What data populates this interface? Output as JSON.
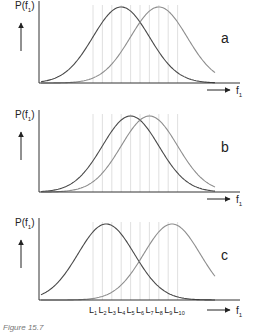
{
  "figure": {
    "caption": "Figure 15.7"
  },
  "chart_data": {
    "type": "line",
    "x_levels": [
      "L1",
      "L2",
      "L3",
      "L4",
      "L5",
      "L6",
      "L7",
      "L8",
      "L9",
      "L10"
    ],
    "level_positions": [
      1,
      2,
      3,
      4,
      5,
      6,
      7,
      8,
      9,
      10
    ],
    "xlabel_main": "f",
    "xlabel_sub": "1",
    "ylabel_main": "P(f",
    "ylabel_sub": "1",
    "ylabel_close": ")",
    "xlim": [
      -5.5,
      16
    ],
    "grid": false,
    "colors": {
      "curve_dark": "#4a4a4a",
      "curve_light": "#8e8e8e",
      "level_line": "#d8d8d8",
      "axis": "#333333"
    },
    "panels": [
      {
        "label": "a",
        "series": [
          {
            "name": "dark",
            "mean": 4.0,
            "sd": 3.0
          },
          {
            "name": "light",
            "mean": 8.0,
            "sd": 3.0
          }
        ]
      },
      {
        "label": "b",
        "series": [
          {
            "name": "dark",
            "mean": 5.0,
            "sd": 3.0
          },
          {
            "name": "light",
            "mean": 7.0,
            "sd": 3.0
          }
        ]
      },
      {
        "label": "c",
        "series": [
          {
            "name": "dark",
            "mean": 2.4,
            "sd": 3.0
          },
          {
            "name": "light",
            "mean": 9.4,
            "sd": 3.0
          }
        ]
      }
    ],
    "show_level_labels_on_panel": "c"
  }
}
